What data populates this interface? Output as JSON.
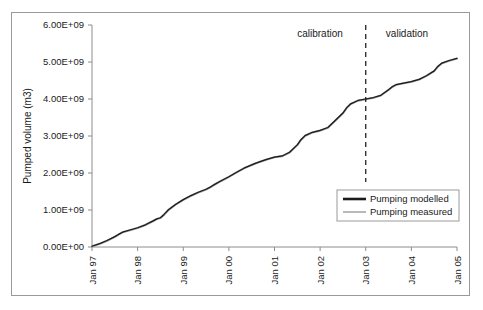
{
  "chart_data": {
    "type": "line",
    "title": "",
    "xlabel": "",
    "ylabel": "Pumped volume (m3)",
    "grid": false,
    "legend_position": "inside-bottom-right",
    "x_tick_labels": [
      "Jan 97",
      "Jan 98",
      "Jan 99",
      "Jan 00",
      "Jan 01",
      "Jan 02",
      "Jan 03",
      "Jan 04",
      "Jan 05"
    ],
    "y_tick_labels": [
      "0.00E+00",
      "1.00E+09",
      "2.00E+09",
      "3.00E+09",
      "4.00E+09",
      "5.00E+09",
      "6.00E+09"
    ],
    "y_tick_values": [
      0,
      1000000000,
      2000000000,
      3000000000,
      4000000000,
      5000000000,
      6000000000
    ],
    "ylim": [
      0,
      6000000000
    ],
    "xlim": [
      "Jan 97",
      "Jan 05"
    ],
    "annotations": [
      {
        "name": "calibration",
        "text": "calibration",
        "x": "Jul 01"
      },
      {
        "name": "validation",
        "text": "validation",
        "x": "Jul 03"
      },
      {
        "name": "period-divider",
        "text": "",
        "x": "Jan 03",
        "style": "dashed-vertical"
      }
    ],
    "x": [
      1997.0,
      1997.17,
      1997.33,
      1997.5,
      1997.58,
      1997.67,
      1997.83,
      1998.0,
      1998.17,
      1998.33,
      1998.42,
      1998.5,
      1998.58,
      1998.67,
      1998.83,
      1999.0,
      1999.17,
      1999.33,
      1999.5,
      1999.58,
      1999.67,
      1999.83,
      2000.0,
      2000.17,
      2000.33,
      2000.5,
      2000.58,
      2000.67,
      2000.83,
      2001.0,
      2001.17,
      2001.33,
      2001.5,
      2001.58,
      2001.67,
      2001.83,
      2002.0,
      2002.17,
      2002.33,
      2002.5,
      2002.58,
      2002.67,
      2002.83,
      2003.0,
      2003.17,
      2003.33,
      2003.5,
      2003.58,
      2003.67,
      2003.83,
      2004.0,
      2004.17,
      2004.33,
      2004.5,
      2004.58,
      2004.67,
      2004.83,
      2005.0
    ],
    "series": [
      {
        "name": "Pumping modelled",
        "color": "#1b1b1b",
        "linewidth": "thick",
        "values": [
          20000000,
          90000000,
          175000000,
          280000000,
          340000000,
          400000000,
          460000000,
          520000000,
          600000000,
          700000000,
          760000000,
          790000000,
          880000000,
          1000000000,
          1150000000,
          1280000000,
          1390000000,
          1480000000,
          1560000000,
          1610000000,
          1680000000,
          1790000000,
          1900000000,
          2020000000,
          2130000000,
          2220000000,
          2260000000,
          2300000000,
          2370000000,
          2430000000,
          2460000000,
          2560000000,
          2760000000,
          2900000000,
          3010000000,
          3100000000,
          3150000000,
          3230000000,
          3420000000,
          3620000000,
          3760000000,
          3870000000,
          3960000000,
          4000000000,
          4040000000,
          4100000000,
          4250000000,
          4330000000,
          4390000000,
          4430000000,
          4470000000,
          4530000000,
          4630000000,
          4760000000,
          4880000000,
          4970000000,
          5040000000,
          5100000000
        ]
      },
      {
        "name": "Pumping measured",
        "color": "#9b9b9b",
        "linewidth": "thin",
        "values": [
          18000000,
          85000000,
          170000000,
          275000000,
          335000000,
          398000000,
          455000000,
          515000000,
          595000000,
          695000000,
          755000000,
          785000000,
          875000000,
          995000000,
          1145000000,
          1275000000,
          1385000000,
          1475000000,
          1555000000,
          1605000000,
          1675000000,
          1785000000,
          1895000000,
          2015000000,
          2125000000,
          2215000000,
          2255000000,
          2295000000,
          2365000000,
          2425000000,
          2455000000,
          2555000000,
          2755000000,
          2895000000,
          3005000000,
          3095000000,
          3145000000,
          3225000000,
          3415000000,
          3615000000,
          3755000000,
          3865000000,
          3955000000,
          3995000000,
          4035000000,
          4095000000,
          4245000000,
          4325000000,
          4385000000,
          4425000000,
          4465000000,
          4525000000,
          4625000000,
          4755000000,
          4875000000,
          4965000000,
          5035000000,
          5095000000
        ]
      }
    ],
    "legend": [
      {
        "label": "Pumping modelled",
        "color": "#1b1b1b"
      },
      {
        "label": "Pumping measured",
        "color": "#9b9b9b"
      }
    ]
  },
  "colors": {
    "modelled": "#1b1b1b",
    "measured": "#9b9b9b",
    "axis": "#8c8c8c",
    "frame": "#9a9a9a",
    "background": "#ffffff",
    "divider": "#111111"
  }
}
